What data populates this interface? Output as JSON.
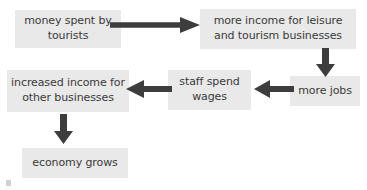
{
  "diagram": {
    "type": "flowchart",
    "colors": {
      "node_fill": "#e9e9e9",
      "text": "#3a3a3a",
      "arrow": "#3d3d3d",
      "background": "#ffffff"
    },
    "nodes": [
      {
        "id": "money",
        "label": "money spent by\ntourists"
      },
      {
        "id": "more_income",
        "label": "more income for leisure\nand tourism businesses"
      },
      {
        "id": "more_jobs",
        "label": "more jobs"
      },
      {
        "id": "staff_wages",
        "label": "staff spend\nwages"
      },
      {
        "id": "increased_income",
        "label": "increased income for\nother businesses"
      },
      {
        "id": "economy",
        "label": "economy grows"
      }
    ],
    "edges": [
      {
        "from": "money",
        "to": "more_income",
        "direction": "right"
      },
      {
        "from": "more_income",
        "to": "more_jobs",
        "direction": "down"
      },
      {
        "from": "more_jobs",
        "to": "staff_wages",
        "direction": "left"
      },
      {
        "from": "staff_wages",
        "to": "increased_income",
        "direction": "left"
      },
      {
        "from": "increased_income",
        "to": "economy",
        "direction": "down"
      }
    ]
  }
}
